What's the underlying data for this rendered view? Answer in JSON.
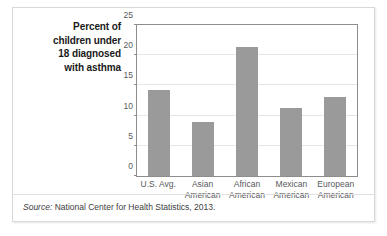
{
  "figure": {
    "title_lines": [
      "Percent of",
      "children under",
      "18 diagnosed",
      "with asthma"
    ],
    "source_label": "Source:",
    "source_text": " National Center for Health Statistics, 2013.",
    "bar_color": "#9a9a9a",
    "frame_color": "#8d8d8d",
    "gridline_color": "#e6e6e6",
    "tick_text_color": "#58595b"
  },
  "chart_data": {
    "type": "bar",
    "title": "Percent of children under 18 diagnosed with asthma",
    "categories": [
      "U.S. Avg.",
      "Asian American",
      "African American",
      "Mexican American",
      "European American"
    ],
    "category_lines": [
      [
        "U.S. Avg.",
        ""
      ],
      [
        "Asian",
        "American"
      ],
      [
        "African",
        "American"
      ],
      [
        "Mexican",
        "American"
      ],
      [
        "European",
        "American"
      ]
    ],
    "values": [
      14.2,
      8.9,
      21.3,
      11.2,
      13.1
    ],
    "xlabel": "",
    "ylabel": "",
    "ylim": [
      0,
      25
    ],
    "yticks": [
      0,
      5,
      10,
      15,
      20,
      25
    ],
    "ytick_labels": [
      "0",
      "5",
      "10",
      "15",
      "20",
      "25"
    ],
    "grid": true,
    "legend": false,
    "source": "Source: National Center for Health Statistics, 2013."
  }
}
